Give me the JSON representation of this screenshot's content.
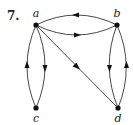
{
  "figure": {
    "number": "7.",
    "nodes": [
      {
        "id": "a",
        "label": "a",
        "x": 36,
        "y": 25,
        "lx": 36,
        "ly": 17
      },
      {
        "id": "b",
        "label": "b",
        "x": 117,
        "y": 25,
        "lx": 117,
        "ly": 17
      },
      {
        "id": "c",
        "label": "c",
        "x": 36,
        "y": 108,
        "lx": 36,
        "ly": 122
      },
      {
        "id": "d",
        "label": "d",
        "x": 118,
        "y": 108,
        "lx": 118,
        "ly": 122
      }
    ],
    "edges": [
      {
        "from": "b",
        "to": "a",
        "curve": "top"
      },
      {
        "from": "a",
        "to": "b",
        "curve": "bottom"
      },
      {
        "from": "c",
        "to": "a",
        "curve": "left"
      },
      {
        "from": "a",
        "to": "c",
        "curve": "right"
      },
      {
        "from": "b",
        "to": "d",
        "curve": "left"
      },
      {
        "from": "d",
        "to": "b",
        "curve": "right"
      },
      {
        "from": "a",
        "to": "d",
        "curve": "straight"
      }
    ]
  }
}
